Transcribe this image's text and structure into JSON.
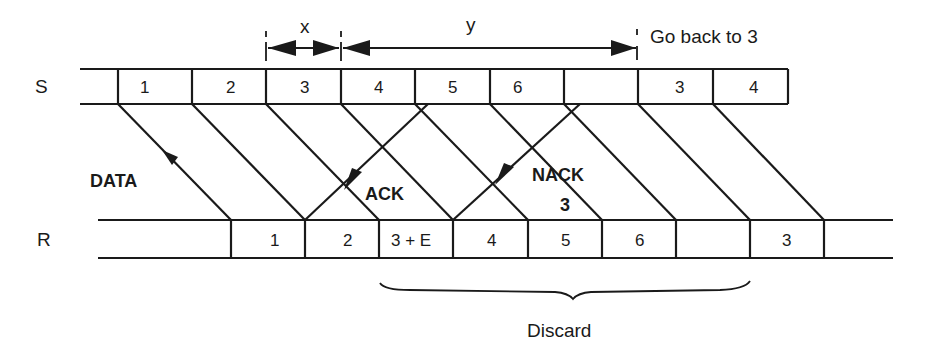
{
  "diagram": {
    "type": "go-back-n ARQ timing diagram",
    "row_labels": {
      "sender": "S",
      "receiver": "R"
    },
    "sender_frames": [
      "1",
      "2",
      "3",
      "4",
      "5",
      "6",
      "",
      "3",
      "4"
    ],
    "receiver_frames": [
      "",
      "1",
      "2",
      "3 + E",
      "4",
      "5",
      "6",
      "",
      "3"
    ],
    "interval_labels": {
      "x": "x",
      "y": "y"
    },
    "annotation_go_back": "Go back to 3",
    "arrow_labels": {
      "data": "DATA",
      "ack": "ACK",
      "nack": "NACK",
      "nack_num": "3"
    },
    "brace_label": "Discard",
    "colors": {
      "line": "#1a1a1a",
      "background": "#ffffff"
    }
  }
}
